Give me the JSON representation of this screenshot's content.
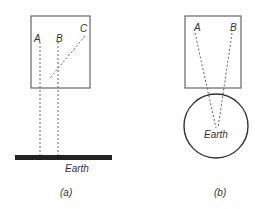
{
  "diagram_a": {
    "caption": "(a)",
    "points": {
      "A": "A",
      "B": "B",
      "C": "C"
    },
    "ground_label": "Earth"
  },
  "diagram_b": {
    "caption": "(b)",
    "points": {
      "A": "A",
      "B": "B"
    },
    "ground_label": "Earth"
  },
  "colors": {
    "stroke": "#555555",
    "dashed": "#666666",
    "bar": "#222222"
  }
}
